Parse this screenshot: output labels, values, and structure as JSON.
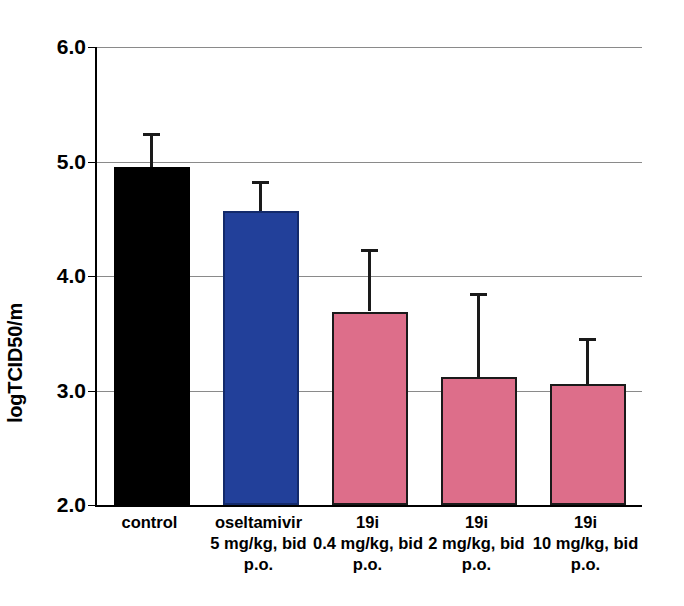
{
  "chart_data": {
    "type": "bar",
    "title": "",
    "xlabel": "",
    "ylabel": "logTCID50/m",
    "ylim": [
      2.0,
      6.0
    ],
    "yticks": [
      "2.0",
      "3.0",
      "4.0",
      "5.0",
      "6.0"
    ],
    "ytick_values": [
      2.0,
      3.0,
      4.0,
      5.0,
      6.0
    ],
    "grid": "horizontal",
    "legend": "none",
    "categories": [
      "control",
      "oseltamivir 5 mg/kg, bid p.o.",
      "19i 0.4 mg/kg, bid p.o.",
      "19i 2 mg/kg, bid p.o.",
      "19i 10 mg/kg, bid p.o."
    ],
    "values": [
      4.95,
      4.57,
      3.69,
      3.12,
      3.06
    ],
    "error_upper": [
      5.25,
      4.83,
      4.24,
      3.85,
      3.46
    ],
    "bars": [
      {
        "name": "control",
        "line1": "control",
        "line2": "",
        "line3": "",
        "value": 4.95,
        "error_top": 5.25,
        "color": "#000000",
        "edge": "#000000"
      },
      {
        "name": "oseltamivir",
        "line1": "oseltamivir",
        "line2": "5 mg/kg, bid",
        "line3": "p.o.",
        "value": 4.57,
        "error_top": 4.83,
        "color": "#22409A",
        "edge": "#132a6b"
      },
      {
        "name": "19i-0.4",
        "line1": "19i",
        "line2": "0.4 mg/kg, bid",
        "line3": "p.o.",
        "value": 3.69,
        "error_top": 4.24,
        "color": "#DD6E8A",
        "edge": "#1a1a1a"
      },
      {
        "name": "19i-2",
        "line1": "19i",
        "line2": "2 mg/kg, bid",
        "line3": "p.o.",
        "value": 3.12,
        "error_top": 3.85,
        "color": "#DD6E8A",
        "edge": "#1a1a1a"
      },
      {
        "name": "19i-10",
        "line1": "19i",
        "line2": "10 mg/kg, bid",
        "line3": "p.o.",
        "value": 3.06,
        "error_top": 3.46,
        "color": "#DD6E8A",
        "edge": "#1a1a1a"
      }
    ],
    "colors": {
      "control": "#000000",
      "oseltamivir": "#22409A",
      "compound_19i": "#DD6E8A",
      "gridline": "#8a8a8a",
      "axis": "#000000",
      "background": "#ffffff"
    }
  }
}
